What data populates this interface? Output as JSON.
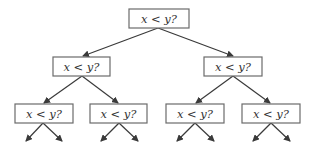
{
  "diagram": {
    "type": "binary-decision-tree",
    "colors": {
      "box_border": "#6b6b6b",
      "edge": "#3a3a3a",
      "text": "#333333",
      "background": "#ffffff"
    },
    "nodes": [
      {
        "id": "root",
        "label": "x < y?",
        "level": 0,
        "x": 129,
        "y": 9,
        "w": 60,
        "h": 19
      },
      {
        "id": "l",
        "label": "x < y?",
        "level": 1,
        "x": 53,
        "y": 57,
        "w": 57,
        "h": 19
      },
      {
        "id": "r",
        "label": "x < y?",
        "level": 1,
        "x": 204,
        "y": 57,
        "w": 58,
        "h": 19
      },
      {
        "id": "ll",
        "label": "x < y?",
        "level": 2,
        "x": 15,
        "y": 104,
        "w": 58,
        "h": 19
      },
      {
        "id": "lr",
        "label": "x < y?",
        "level": 2,
        "x": 90,
        "y": 104,
        "w": 57,
        "h": 19
      },
      {
        "id": "rl",
        "label": "x < y?",
        "level": 2,
        "x": 166,
        "y": 104,
        "w": 58,
        "h": 19
      },
      {
        "id": "rr",
        "label": "x < y?",
        "level": 2,
        "x": 242,
        "y": 104,
        "w": 58,
        "h": 19
      }
    ],
    "edges": [
      {
        "from": "root",
        "to": "l"
      },
      {
        "from": "root",
        "to": "r"
      },
      {
        "from": "l",
        "to": "ll"
      },
      {
        "from": "l",
        "to": "lr"
      },
      {
        "from": "r",
        "to": "rl"
      },
      {
        "from": "r",
        "to": "rr"
      },
      {
        "from": "ll",
        "to": "leaf"
      },
      {
        "from": "ll",
        "to": "leaf"
      },
      {
        "from": "lr",
        "to": "leaf"
      },
      {
        "from": "lr",
        "to": "leaf"
      },
      {
        "from": "rl",
        "to": "leaf"
      },
      {
        "from": "rl",
        "to": "leaf"
      },
      {
        "from": "rr",
        "to": "leaf"
      },
      {
        "from": "rr",
        "to": "leaf"
      }
    ]
  }
}
